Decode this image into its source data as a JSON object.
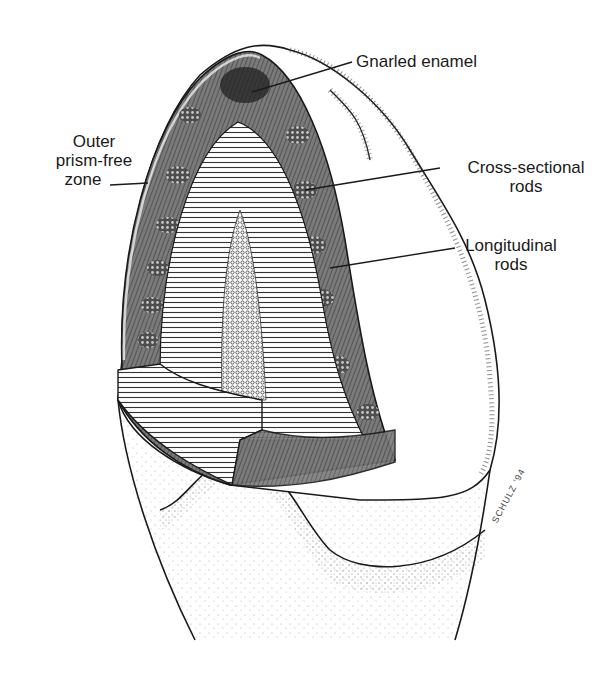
{
  "figure": {
    "labels": {
      "gnarled_enamel": "Gnarled enamel",
      "outer_prism_free": {
        "line1": "Outer",
        "line2": "prism-free",
        "line3": "zone"
      },
      "cross_sectional": {
        "line1": "Cross-sectional",
        "line2": "rods"
      },
      "longitudinal": {
        "line1": "Longitudinal",
        "line2": "rods"
      }
    },
    "signature": "SCHULZ '94"
  },
  "colors": {
    "ink": "#1a1a1a",
    "enamel_shade": "#6e6e6e",
    "dentin_light": "#d8d8d8",
    "paper": "#ffffff"
  }
}
